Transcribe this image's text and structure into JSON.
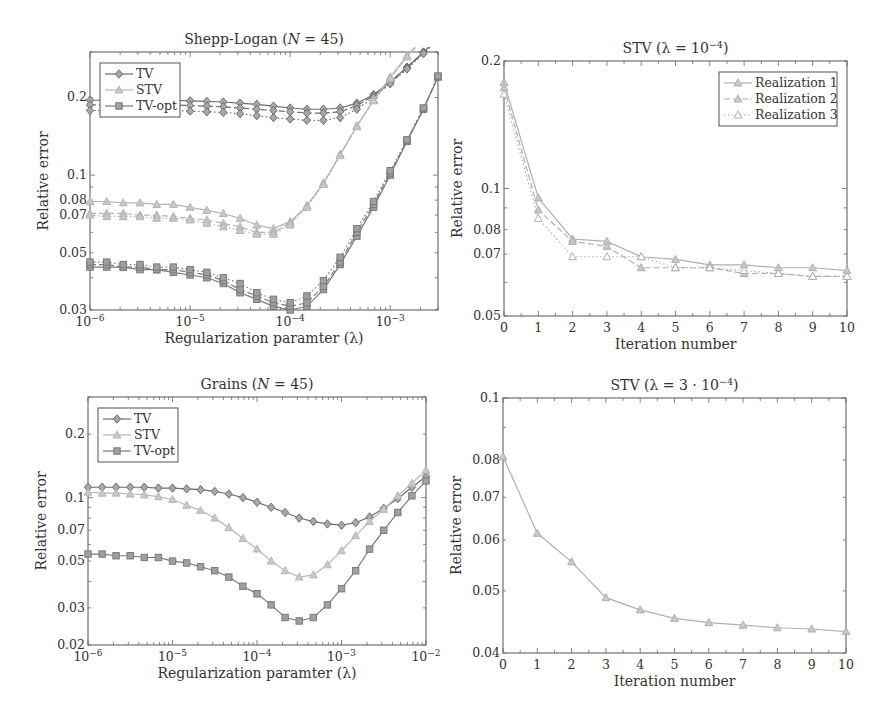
{
  "chart_data": [
    {
      "id": "shepp",
      "type": "line",
      "title": "Shepp-Logan (N = 45)",
      "title_parts": [
        "Shepp-Logan (",
        "N",
        " = 45)"
      ],
      "xlabel": "Regularization paramter (λ)",
      "ylabel": "Relative error",
      "xscale": "log",
      "yscale": "log",
      "xlim": [
        1e-06,
        0.003
      ],
      "ylim": [
        0.03,
        0.3
      ],
      "xticks": [
        {
          "v": 1e-06,
          "base": "10",
          "exp": "−6"
        },
        {
          "v": 1e-05,
          "base": "10",
          "exp": "−5"
        },
        {
          "v": 0.0001,
          "base": "10",
          "exp": "−4"
        },
        {
          "v": 0.001,
          "base": "10",
          "exp": "−3"
        }
      ],
      "yticks": [
        {
          "v": 0.03,
          "label": "0.03"
        },
        {
          "v": 0.05,
          "label": "0.05"
        },
        {
          "v": 0.07,
          "label": "0.07"
        },
        {
          "v": 0.08,
          "label": "0.08"
        },
        {
          "v": 0.1,
          "label": "0.1"
        },
        {
          "v": 0.2,
          "label": "0.2"
        }
      ],
      "legend": {
        "position": "upper-left",
        "entries": [
          "TV",
          "STV",
          "TV-opt"
        ]
      },
      "x": [
        1e-06,
        1.47e-06,
        2.15e-06,
        3.16e-06,
        4.64e-06,
        6.81e-06,
        1e-05,
        1.47e-05,
        2.15e-05,
        3.16e-05,
        4.64e-05,
        6.81e-05,
        0.0001,
        0.000147,
        0.000215,
        0.000316,
        0.000464,
        0.000681,
        0.001,
        0.00147,
        0.00215,
        0.003
      ],
      "series": [
        {
          "name": "TV (realization 1)",
          "legend": "TV",
          "marker": "diamond",
          "color": "#6e6e6e",
          "dash": "solid",
          "values": [
            0.195,
            0.195,
            0.195,
            0.195,
            0.195,
            0.195,
            0.194,
            0.193,
            0.192,
            0.19,
            0.188,
            0.185,
            0.182,
            0.18,
            0.18,
            0.182,
            0.19,
            0.205,
            0.23,
            0.262,
            0.3,
            0.34
          ]
        },
        {
          "name": "TV (realization 2)",
          "legend": "TV",
          "marker": "diamond",
          "color": "#6e6e6e",
          "dash": "dashed",
          "values": [
            0.187,
            0.187,
            0.187,
            0.187,
            0.187,
            0.187,
            0.186,
            0.185,
            0.184,
            0.182,
            0.18,
            0.178,
            0.176,
            0.174,
            0.174,
            0.176,
            0.186,
            0.203,
            0.228,
            0.26,
            0.298,
            0.338
          ]
        },
        {
          "name": "TV (realization 3)",
          "legend": "TV",
          "marker": "diamond",
          "color": "#6e6e6e",
          "dash": "dotted",
          "values": [
            0.178,
            0.178,
            0.178,
            0.178,
            0.178,
            0.178,
            0.177,
            0.176,
            0.175,
            0.173,
            0.17,
            0.167,
            0.165,
            0.163,
            0.163,
            0.167,
            0.18,
            0.2,
            0.226,
            0.258,
            0.296,
            0.336
          ]
        },
        {
          "name": "STV (realization 1)",
          "legend": "STV",
          "marker": "triangle",
          "color": "#b5b5b5",
          "dash": "solid",
          "values": [
            0.079,
            0.079,
            0.078,
            0.078,
            0.077,
            0.077,
            0.075,
            0.073,
            0.071,
            0.068,
            0.064,
            0.062,
            0.066,
            0.076,
            0.093,
            0.12,
            0.155,
            0.195,
            0.24,
            0.29,
            0.34,
            0.38
          ]
        },
        {
          "name": "STV (realization 2)",
          "legend": "STV",
          "marker": "triangle",
          "color": "#b5b5b5",
          "dash": "dashed",
          "values": [
            0.071,
            0.071,
            0.071,
            0.07,
            0.07,
            0.069,
            0.068,
            0.067,
            0.065,
            0.063,
            0.06,
            0.06,
            0.065,
            0.076,
            0.093,
            0.12,
            0.155,
            0.195,
            0.238,
            0.288,
            0.338,
            0.378
          ]
        },
        {
          "name": "STV (realization 3)",
          "legend": "STV",
          "marker": "triangle",
          "color": "#b5b5b5",
          "dash": "dotted",
          "values": [
            0.07,
            0.069,
            0.069,
            0.069,
            0.068,
            0.068,
            0.067,
            0.065,
            0.063,
            0.061,
            0.059,
            0.059,
            0.064,
            0.075,
            0.092,
            0.119,
            0.154,
            0.194,
            0.237,
            0.287,
            0.337,
            0.377
          ]
        },
        {
          "name": "TV-opt (realization 1)",
          "legend": "TV-opt",
          "marker": "square",
          "color": "#7a7a7a",
          "dash": "solid",
          "values": [
            0.044,
            0.044,
            0.044,
            0.043,
            0.043,
            0.042,
            0.041,
            0.04,
            0.038,
            0.035,
            0.033,
            0.031,
            0.03,
            0.031,
            0.036,
            0.045,
            0.058,
            0.075,
            0.1,
            0.135,
            0.18,
            0.24
          ]
        },
        {
          "name": "TV-opt (realization 2)",
          "legend": "TV-opt",
          "marker": "square",
          "color": "#7a7a7a",
          "dash": "dashed",
          "values": [
            0.045,
            0.045,
            0.044,
            0.044,
            0.043,
            0.043,
            0.042,
            0.041,
            0.039,
            0.036,
            0.034,
            0.032,
            0.031,
            0.032,
            0.037,
            0.046,
            0.06,
            0.077,
            0.102,
            0.136,
            0.181,
            0.241
          ]
        },
        {
          "name": "TV-opt (realization 3)",
          "legend": "TV-opt",
          "marker": "square",
          "color": "#7a7a7a",
          "dash": "dotted",
          "values": [
            0.046,
            0.046,
            0.045,
            0.045,
            0.044,
            0.044,
            0.043,
            0.042,
            0.04,
            0.038,
            0.035,
            0.033,
            0.032,
            0.034,
            0.039,
            0.048,
            0.062,
            0.079,
            0.104,
            0.137,
            0.182,
            0.242
          ]
        }
      ]
    },
    {
      "id": "stv1",
      "type": "line",
      "title": "STV (λ = 10⁻⁴)",
      "title_parts": [
        "STV (λ = 10",
        "−4",
        ")"
      ],
      "xlabel": "Iteration number",
      "ylabel": "Relative error",
      "xscale": "linear",
      "yscale": "log",
      "xlim": [
        0,
        10
      ],
      "ylim": [
        0.05,
        0.2
      ],
      "xticks": [
        {
          "v": 0,
          "label": "0"
        },
        {
          "v": 1,
          "label": "1"
        },
        {
          "v": 2,
          "label": "2"
        },
        {
          "v": 3,
          "label": "3"
        },
        {
          "v": 4,
          "label": "4"
        },
        {
          "v": 5,
          "label": "5"
        },
        {
          "v": 6,
          "label": "6"
        },
        {
          "v": 7,
          "label": "7"
        },
        {
          "v": 8,
          "label": "8"
        },
        {
          "v": 9,
          "label": "9"
        },
        {
          "v": 10,
          "label": "10"
        }
      ],
      "yticks": [
        {
          "v": 0.05,
          "label": "0.05"
        },
        {
          "v": 0.07,
          "label": "0.07"
        },
        {
          "v": 0.08,
          "label": "0.08"
        },
        {
          "v": 0.1,
          "label": "0.1"
        },
        {
          "v": 0.2,
          "label": "0.2"
        }
      ],
      "legend": {
        "position": "upper-right",
        "entries": [
          "Realization 1",
          "Realization 2",
          "Realization 3"
        ]
      },
      "x": [
        0,
        1,
        2,
        3,
        4,
        5,
        6,
        7,
        8,
        9,
        10
      ],
      "series": [
        {
          "name": "Realization 1",
          "legend": "Realization 1",
          "marker": "triangle",
          "color": "#b0b0b0",
          "dash": "solid",
          "values": [
            0.178,
            0.095,
            0.076,
            0.075,
            0.069,
            0.068,
            0.066,
            0.066,
            0.065,
            0.065,
            0.064
          ]
        },
        {
          "name": "Realization 2",
          "legend": "Realization 2",
          "marker": "triangle",
          "color": "#b0b0b0",
          "dash": "dashed",
          "values": [
            0.173,
            0.089,
            0.075,
            0.073,
            0.065,
            0.065,
            0.065,
            0.063,
            0.063,
            0.062,
            0.062
          ]
        },
        {
          "name": "Realization 3",
          "legend": "Realization 3",
          "marker": "triangle-open",
          "color": "#b0b0b0",
          "dash": "dotted",
          "values": [
            0.167,
            0.085,
            0.069,
            0.069,
            0.069,
            0.065,
            0.065,
            0.064,
            0.063,
            0.062,
            0.062
          ]
        }
      ]
    },
    {
      "id": "grains",
      "type": "line",
      "title": "Grains (N = 45)",
      "title_parts": [
        "Grains (",
        "N",
        " = 45)"
      ],
      "xlabel": "Regularization paramter (λ)",
      "ylabel": "Relative error",
      "xscale": "log",
      "yscale": "log",
      "xlim": [
        1e-06,
        0.01
      ],
      "ylim": [
        0.02,
        0.3
      ],
      "xticks": [
        {
          "v": 1e-06,
          "base": "10",
          "exp": "−6"
        },
        {
          "v": 1e-05,
          "base": "10",
          "exp": "−5"
        },
        {
          "v": 0.0001,
          "base": "10",
          "exp": "−4"
        },
        {
          "v": 0.001,
          "base": "10",
          "exp": "−3"
        },
        {
          "v": 0.01,
          "base": "10",
          "exp": "−2"
        }
      ],
      "yticks": [
        {
          "v": 0.02,
          "label": "0.02"
        },
        {
          "v": 0.03,
          "label": "0.03"
        },
        {
          "v": 0.05,
          "label": "0.05"
        },
        {
          "v": 0.07,
          "label": "0.07"
        },
        {
          "v": 0.1,
          "label": "0.1"
        },
        {
          "v": 0.2,
          "label": "0.2"
        }
      ],
      "legend": {
        "position": "upper-left",
        "entries": [
          "TV",
          "STV",
          "TV-opt"
        ]
      },
      "x": [
        1e-06,
        1.47e-06,
        2.15e-06,
        3.16e-06,
        4.64e-06,
        6.81e-06,
        1e-05,
        1.47e-05,
        2.15e-05,
        3.16e-05,
        4.64e-05,
        6.81e-05,
        0.0001,
        0.000147,
        0.000215,
        0.000316,
        0.000464,
        0.000681,
        0.001,
        0.00147,
        0.00215,
        0.00316,
        0.00464,
        0.00681,
        0.01
      ],
      "series": [
        {
          "name": "TV",
          "legend": "TV",
          "marker": "diamond",
          "color": "#6e6e6e",
          "dash": "solid",
          "values": [
            0.112,
            0.112,
            0.112,
            0.112,
            0.112,
            0.111,
            0.111,
            0.11,
            0.109,
            0.107,
            0.104,
            0.1,
            0.095,
            0.09,
            0.085,
            0.08,
            0.077,
            0.075,
            0.074,
            0.076,
            0.081,
            0.089,
            0.099,
            0.112,
            0.126
          ]
        },
        {
          "name": "STV",
          "legend": "STV",
          "marker": "triangle",
          "color": "#b8b8b8",
          "dash": "solid",
          "values": [
            0.106,
            0.105,
            0.105,
            0.104,
            0.103,
            0.101,
            0.098,
            0.092,
            0.087,
            0.08,
            0.072,
            0.064,
            0.057,
            0.05,
            0.045,
            0.042,
            0.043,
            0.048,
            0.056,
            0.066,
            0.077,
            0.088,
            0.102,
            0.117,
            0.135
          ]
        },
        {
          "name": "TV-opt",
          "legend": "TV-opt",
          "marker": "square",
          "color": "#7a7a7a",
          "dash": "solid",
          "values": [
            0.054,
            0.054,
            0.053,
            0.053,
            0.052,
            0.052,
            0.05,
            0.049,
            0.047,
            0.045,
            0.042,
            0.038,
            0.035,
            0.031,
            0.027,
            0.026,
            0.027,
            0.031,
            0.037,
            0.045,
            0.057,
            0.07,
            0.085,
            0.102,
            0.12
          ]
        }
      ]
    },
    {
      "id": "stv2",
      "type": "line",
      "title": "STV (λ = 3·10⁻⁴)",
      "title_parts": [
        "STV (λ = 3 · 10",
        "−4",
        ")"
      ],
      "xlabel": "Iteration number",
      "ylabel": "Relative error",
      "xscale": "linear",
      "yscale": "log",
      "xlim": [
        0,
        10
      ],
      "ylim": [
        0.04,
        0.1
      ],
      "xticks": [
        {
          "v": 0,
          "label": "0"
        },
        {
          "v": 1,
          "label": "1"
        },
        {
          "v": 2,
          "label": "2"
        },
        {
          "v": 3,
          "label": "3"
        },
        {
          "v": 4,
          "label": "4"
        },
        {
          "v": 5,
          "label": "5"
        },
        {
          "v": 6,
          "label": "6"
        },
        {
          "v": 7,
          "label": "7"
        },
        {
          "v": 8,
          "label": "8"
        },
        {
          "v": 9,
          "label": "9"
        },
        {
          "v": 10,
          "label": "10"
        }
      ],
      "yticks": [
        {
          "v": 0.04,
          "label": "0.04"
        },
        {
          "v": 0.05,
          "label": "0.05"
        },
        {
          "v": 0.06,
          "label": "0.06"
        },
        {
          "v": 0.07,
          "label": "0.07"
        },
        {
          "v": 0.08,
          "label": "0.08"
        },
        {
          "v": 0.1,
          "label": "0.1"
        }
      ],
      "legend": null,
      "x": [
        0,
        1,
        2,
        3,
        4,
        5,
        6,
        7,
        8,
        9,
        10
      ],
      "series": [
        {
          "name": "STV",
          "legend": "STV",
          "marker": "triangle",
          "color": "#b0b0b0",
          "dash": "solid",
          "values": [
            0.081,
            0.0615,
            0.0555,
            0.0488,
            0.0467,
            0.0453,
            0.0446,
            0.0442,
            0.0438,
            0.0436,
            0.0432
          ]
        }
      ]
    }
  ],
  "panels": [
    {
      "chart": 0,
      "left": 0,
      "top": 0,
      "width": 442,
      "height": 360,
      "plot": {
        "x": 90,
        "y": 52,
        "w": 348,
        "h": 258
      }
    },
    {
      "chart": 1,
      "left": 442,
      "top": 0,
      "width": 442,
      "height": 360,
      "plot": {
        "x": 62,
        "y": 61,
        "w": 343,
        "h": 255
      }
    },
    {
      "chart": 2,
      "left": 0,
      "top": 360,
      "width": 442,
      "height": 360,
      "plot": {
        "x": 88,
        "y": 37,
        "w": 338,
        "h": 248
      }
    },
    {
      "chart": 3,
      "left": 442,
      "top": 360,
      "width": 442,
      "height": 360,
      "plot": {
        "x": 61,
        "y": 38,
        "w": 343,
        "h": 255
      }
    }
  ]
}
